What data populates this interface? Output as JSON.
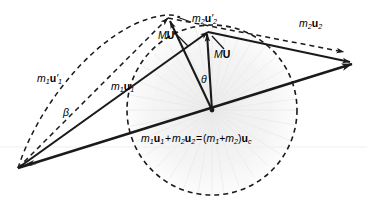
{
  "figure": {
    "width": 367,
    "height": 209,
    "background_color": "#ffffff",
    "stroke_color": "#1a1a1a",
    "dashed_color": "#1a1a1a",
    "fan_color": "#e2e2e2"
  },
  "labels": {
    "m1u1_primed": {
      "m": "m",
      "m_sub": "1",
      "u": "u",
      "prime": "′",
      "u_sub": "2_unused"
    },
    "m1u1_primed_text": "m1u′1",
    "m1u1_text": "m1u1",
    "m2u2_primed_text": "m2u′2",
    "m2u2_text": "m2u2",
    "MU_primed_text": "MU′",
    "MU_text": "MU",
    "theta_text": "θ",
    "beta_text": "β",
    "equation_text": "m1u1 + m2u2 = (m1+m2)uc"
  },
  "annotations": [
    {
      "name": "m1-u1-prime-label",
      "parts": [
        {
          "text": "m",
          "style": "italic"
        },
        {
          "text": "1",
          "style": "sub"
        },
        {
          "text": "u",
          "style": "bold"
        },
        {
          "text": "′",
          "style": "prime"
        },
        {
          "text": "1",
          "style": "sub"
        }
      ],
      "x": 37,
      "y": 79,
      "description": "label of dashed outgoing momentum vector of body 1"
    },
    {
      "name": "m1-u1-label",
      "parts": [
        {
          "text": "m",
          "style": "italic"
        },
        {
          "text": "1",
          "style": "sub"
        },
        {
          "text": "u",
          "style": "bold"
        },
        {
          "text": "1",
          "style": "sub"
        }
      ],
      "x": 111,
      "y": 87,
      "description": "label of solid incoming momentum vector of body 1"
    },
    {
      "name": "m2-u2-prime-label",
      "parts": [
        {
          "text": "m",
          "style": "italic"
        },
        {
          "text": "2",
          "style": "sub"
        },
        {
          "text": "u",
          "style": "bold"
        },
        {
          "text": "′",
          "style": "prime"
        },
        {
          "text": "2",
          "style": "sub"
        }
      ],
      "x": 192,
      "y": 19,
      "description": "label of dashed outgoing momentum vector of body 2"
    },
    {
      "name": "m2-u2-label",
      "parts": [
        {
          "text": "m",
          "style": "italic"
        },
        {
          "text": "2",
          "style": "sub"
        },
        {
          "text": "u",
          "style": "bold"
        },
        {
          "text": "2",
          "style": "sub"
        }
      ],
      "x": 299,
      "y": 24,
      "description": "label of solid incoming momentum vector of body 2"
    },
    {
      "name": "mu-prime-label",
      "parts": [
        {
          "text": "M",
          "style": "italic"
        },
        {
          "text": "U",
          "style": "bold"
        },
        {
          "text": "′",
          "style": "prime"
        }
      ],
      "x": 158,
      "y": 36,
      "description": "label of reduced-mass relative momentum after collision"
    },
    {
      "name": "mu-label",
      "parts": [
        {
          "text": "M",
          "style": "italic"
        },
        {
          "text": "U",
          "style": "bold"
        }
      ],
      "x": 214,
      "y": 55,
      "description": "label of reduced-mass relative momentum before collision"
    },
    {
      "name": "theta-angle-label",
      "parts": [
        {
          "text": "θ",
          "style": "italic"
        }
      ],
      "x": 201,
      "y": 80,
      "description": "scattering angle between MU and MU prime"
    },
    {
      "name": "beta-angle-label",
      "parts": [
        {
          "text": "β",
          "style": "italic"
        }
      ],
      "x": 63,
      "y": 113,
      "description": "laboratory deflection angle of body 1"
    }
  ],
  "equation": {
    "name": "momentum-conservation-equation",
    "x": 141,
    "y": 139,
    "parts": [
      {
        "text": "m",
        "style": "italic"
      },
      {
        "text": "1",
        "style": "sub"
      },
      {
        "text": "u",
        "style": "bold"
      },
      {
        "text": "1",
        "style": "sub"
      },
      {
        "text": " + ",
        "style": "plain"
      },
      {
        "text": "m",
        "style": "italic"
      },
      {
        "text": "2",
        "style": "sub"
      },
      {
        "text": "u",
        "style": "bold"
      },
      {
        "text": "2",
        "style": "sub"
      },
      {
        "text": " = (",
        "style": "plain"
      },
      {
        "text": "m",
        "style": "italic"
      },
      {
        "text": "1",
        "style": "sub"
      },
      {
        "text": "+",
        "style": "plain"
      },
      {
        "text": "m",
        "style": "italic"
      },
      {
        "text": "2",
        "style": "sub"
      },
      {
        "text": ")",
        "style": "plain"
      },
      {
        "text": "u",
        "style": "bold"
      },
      {
        "text": "c",
        "style": "sub"
      }
    ]
  },
  "geometry": {
    "origin_point": {
      "x": 18,
      "y": 168,
      "name": "common-tail-origin"
    },
    "center_point": {
      "x": 212,
      "y": 110,
      "name": "circle-center-vertex"
    },
    "circle": {
      "cx": 212,
      "cy": 110,
      "r": 85,
      "dash": "5,4"
    },
    "ellipse_arc": {
      "cx": 150,
      "cy": 62,
      "rx": 62,
      "ry": 52,
      "rotation": -28
    },
    "vectors": [
      {
        "name": "m1-u1-vector",
        "style": "solid",
        "x1": 18,
        "y1": 168,
        "x2": 208,
        "y2": 32,
        "head": "end"
      },
      {
        "name": "m1-u1-prime-vector",
        "style": "dashed",
        "x1": 18,
        "y1": 168,
        "x2": 168,
        "y2": 18,
        "head": "end"
      },
      {
        "name": "m2-u2-vector",
        "style": "solid",
        "x1": 208,
        "y1": 32,
        "x2": 351,
        "y2": 62,
        "head": "end"
      },
      {
        "name": "m2-u2-prime-vector",
        "style": "dashed",
        "x1": 168,
        "y1": 18,
        "x2": 346,
        "y2": 53,
        "head": "end"
      },
      {
        "name": "resultant-total-momentum-vector",
        "style": "solid",
        "x1": 18,
        "y1": 168,
        "x2": 352,
        "y2": 63,
        "head": "end"
      },
      {
        "name": "mu-vector",
        "style": "solid",
        "x1": 212,
        "y1": 110,
        "x2": 208,
        "y2": 32,
        "head": "end"
      },
      {
        "name": "mu-prime-vector",
        "style": "solid",
        "x1": 212,
        "y1": 110,
        "x2": 168,
        "y2": 18,
        "head": "end"
      }
    ],
    "leaders": [
      {
        "name": "mu-prime-leader",
        "x1": 172,
        "y1": 31,
        "x2": 186,
        "y2": 47
      },
      {
        "name": "mu-leader",
        "x1": 223,
        "y1": 48,
        "x2": 212,
        "y2": 36
      },
      {
        "name": "m2-u2-prime-leader",
        "x1": 190,
        "y1": 23,
        "x2": 176,
        "y2": 18
      }
    ],
    "theta_arc": {
      "cx": 212,
      "cy": 110,
      "r": 26
    }
  }
}
